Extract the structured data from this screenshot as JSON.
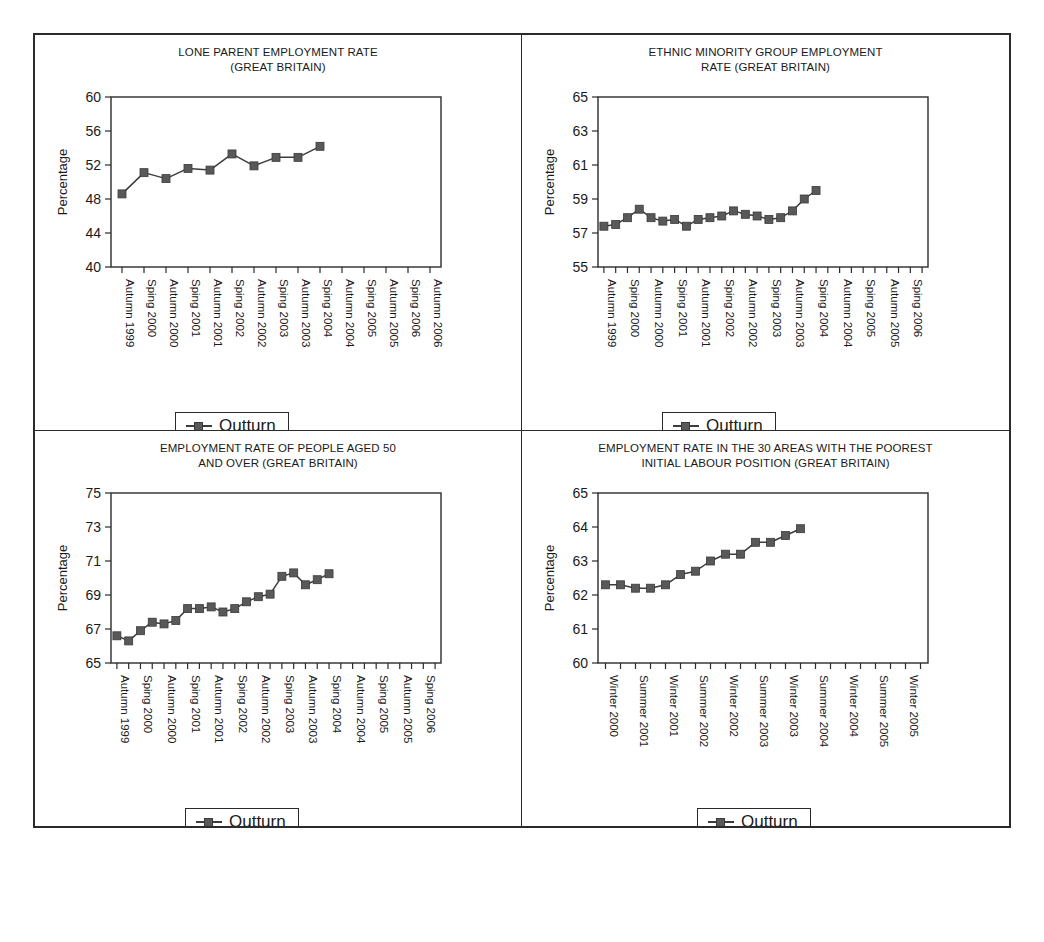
{
  "legend": {
    "series_label": "Outturn",
    "marker": "line-marker-square"
  },
  "common": {
    "ylabel": "Percentage"
  },
  "charts": [
    {
      "id": "lone-parent-employment-rate",
      "title_line1": "LONE PARENT EMPLOYMENT RATE",
      "title_line2": "(GREAT BRITAIN)",
      "chart_data": {
        "type": "line",
        "title": "LONE PARENT EMPLOYMENT RATE (GREAT BRITAIN)",
        "xlabel": "",
        "ylabel": "Percentage",
        "ylim": [
          40,
          60
        ],
        "yticks": [
          40,
          44,
          48,
          52,
          56,
          60
        ],
        "grid": false,
        "legend_position": "bottom-center",
        "categories": [
          "Autumn 1999",
          "Sping 2000",
          "Autumn 2000",
          "Sping 2001",
          "Autumn 2001",
          "Sping 2002",
          "Autumn 2002",
          "Sping 2003",
          "Autumn 2003",
          "Sping 2004",
          "Autumn 2004",
          "Sping 2005",
          "Autumn 2005",
          "Sping 2006",
          "Autumn 2006"
        ],
        "series": [
          {
            "name": "Outturn",
            "values": [
              48.6,
              51.1,
              50.4,
              51.6,
              51.4,
              53.3,
              51.9,
              52.9,
              52.9,
              54.2
            ]
          }
        ]
      }
    },
    {
      "id": "ethnic-minority-group-employment-rate",
      "title_line1": "ETHNIC MINORITY GROUP EMPLOYMENT",
      "title_line2": "RATE (GREAT BRITAIN)",
      "chart_data": {
        "type": "line",
        "title": "ETHNIC MINORITY GROUP EMPLOYMENT RATE (GREAT BRITAIN)",
        "xlabel": "",
        "ylabel": "Percentage",
        "ylim": [
          55,
          65
        ],
        "yticks": [
          55,
          57,
          59,
          61,
          63,
          65
        ],
        "grid": false,
        "legend_position": "bottom-center",
        "categories": [
          "Autumn 1999",
          "Sping 2000",
          "Autumn 2000",
          "Sping 2001",
          "Autumn 2001",
          "Sping 2002",
          "Autumn 2002",
          "Sping 2003",
          "Autumn 2003",
          "Sping 2004",
          "Autumn 2004",
          "Sping 2005",
          "Autumn 2005",
          "Sping 2006"
        ],
        "series": [
          {
            "name": "Outturn",
            "values": [
              57.4,
              57.5,
              57.9,
              58.4,
              57.9,
              57.7,
              57.8,
              57.4,
              57.8,
              57.9,
              58.0,
              58.3,
              58.1,
              58.0,
              57.8,
              57.9,
              58.3,
              59.0,
              59.5
            ]
          }
        ]
      }
    },
    {
      "id": "employment-rate-people-aged-50-and-over",
      "title_line1": "EMPLOYMENT RATE OF PEOPLE AGED 50",
      "title_line2": "AND OVER (GREAT BRITAIN)",
      "chart_data": {
        "type": "line",
        "title": "EMPLOYMENT RATE OF PEOPLE AGED 50 AND OVER (GREAT BRITAIN)",
        "xlabel": "",
        "ylabel": "Percentage",
        "ylim": [
          65,
          75
        ],
        "yticks": [
          65,
          67,
          69,
          71,
          73,
          75
        ],
        "grid": false,
        "legend_position": "bottom-center",
        "categories": [
          "Autumn 1999",
          "Sping 2000",
          "Autumn 2000",
          "Sping 2001",
          "Autumn 2001",
          "Sping 2002",
          "Autumn 2002",
          "Sping 2003",
          "Autumn 2003",
          "Sping 2004",
          "Autumn 2004",
          "Sping 2005",
          "Autumn 2005",
          "Sping 2006"
        ],
        "series": [
          {
            "name": "Outturn",
            "values": [
              66.6,
              66.3,
              66.9,
              67.4,
              67.3,
              67.5,
              68.2,
              68.2,
              68.3,
              68.0,
              68.2,
              68.6,
              68.9,
              69.05,
              70.1,
              70.3,
              69.6,
              69.9,
              70.25
            ]
          }
        ]
      }
    },
    {
      "id": "employment-rate-30-areas-poorest-initial-labour-position",
      "title_line1": "EMPLOYMENT RATE IN THE 30 AREAS WITH THE POOREST",
      "title_line2": "INITIAL LABOUR POSITION (GREAT BRITAIN)",
      "chart_data": {
        "type": "line",
        "title": "EMPLOYMENT RATE IN THE 30 AREAS WITH THE POOREST INITIAL LABOUR POSITION (GREAT BRITAIN)",
        "xlabel": "",
        "ylabel": "Percentage",
        "ylim": [
          60,
          65
        ],
        "yticks": [
          60,
          61,
          62,
          63,
          64,
          65
        ],
        "grid": false,
        "legend_position": "bottom-center",
        "categories": [
          "Winter 2000",
          "Summer 2001",
          "Winter 2001",
          "Summer 2002",
          "Winter 2002",
          "Summer 2003",
          "Winter 2003",
          "Summer 2004",
          "Winter 2004",
          "Summer 2005",
          "Winter 2005"
        ],
        "series": [
          {
            "name": "Outturn",
            "values": [
              62.3,
              62.3,
              62.2,
              62.2,
              62.3,
              62.6,
              62.7,
              63.0,
              63.2,
              63.2,
              63.55,
              63.55,
              63.75,
              63.95
            ]
          }
        ]
      }
    }
  ]
}
